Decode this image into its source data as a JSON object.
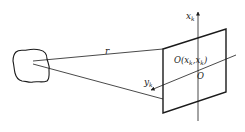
{
  "diagram": {
    "type": "geometry-projection",
    "colors": {
      "stroke": "#1a1a1a",
      "background": "#ffffff"
    },
    "labels": {
      "range": "r",
      "vertical_axis": "x",
      "vertical_axis_sub": "k",
      "horizontal_axis": "y",
      "horizontal_axis_sub": "k",
      "center_point_prefix": "O(x",
      "center_point_sub1": "k",
      "center_point_mid": ",x",
      "center_point_sub2": "k",
      "center_point_suffix": ")",
      "origin": "O"
    },
    "elements": [
      "object-blob",
      "range-line-r",
      "lower-line",
      "image-plane",
      "x-axis-vertical",
      "y-axis-diagonal"
    ]
  }
}
